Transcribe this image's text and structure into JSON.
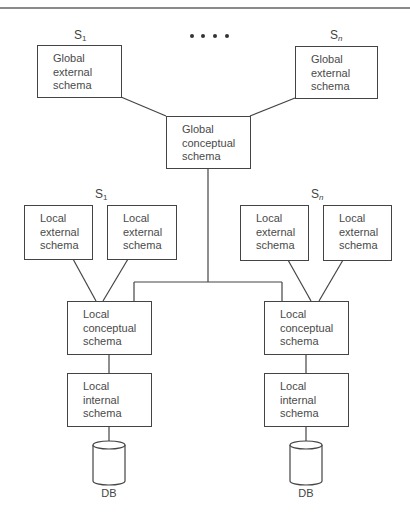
{
  "diagram": {
    "global": {
      "sites": [
        {
          "label": "S",
          "subscript": "1",
          "box": [
            "Global",
            "external",
            "schema"
          ]
        },
        {
          "label": "S",
          "subscript": "n",
          "box": [
            "Global",
            "external",
            "schema"
          ]
        }
      ],
      "ellipsis": "• • • •",
      "conceptual": [
        "Global",
        "conceptual",
        "schema"
      ]
    },
    "local_sites": [
      {
        "label": "S",
        "subscript": "1",
        "external": [
          [
            "Local",
            "external",
            "schema"
          ],
          [
            "Local",
            "external",
            "schema"
          ]
        ],
        "conceptual": [
          "Local",
          "conceptual",
          "schema"
        ],
        "internal": [
          "Local",
          "internal",
          "schema"
        ],
        "db": "DB"
      },
      {
        "label": "S",
        "subscript": "n",
        "external": [
          [
            "Local",
            "external",
            "schema"
          ],
          [
            "Local",
            "external",
            "schema"
          ]
        ],
        "conceptual": [
          "Local",
          "conceptual",
          "schema"
        ],
        "internal": [
          "Local",
          "internal",
          "schema"
        ],
        "db": "DB"
      }
    ],
    "colors": {
      "line": "#444444",
      "text": "#4a4a4a",
      "background": "#ffffff"
    }
  }
}
